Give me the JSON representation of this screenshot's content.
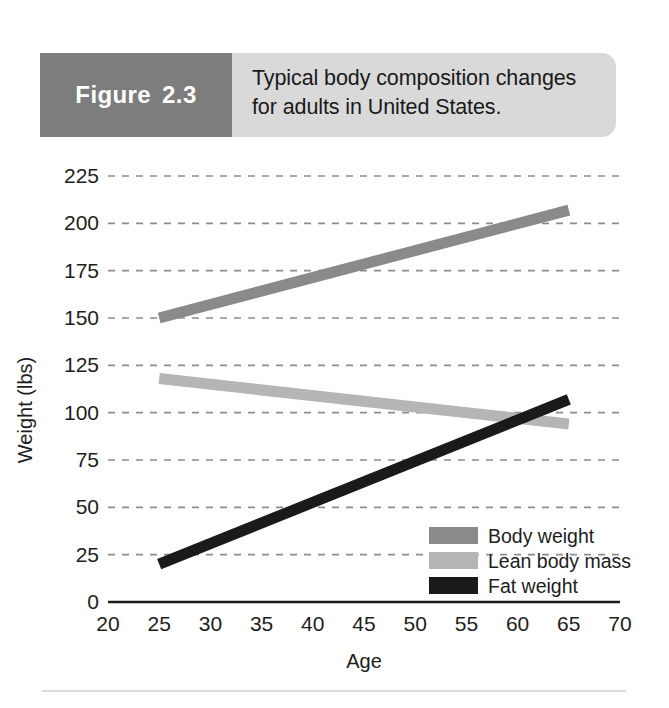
{
  "figure": {
    "tab_word": "Figure",
    "tab_number": "2.3",
    "caption_line1": "Typical body composition changes",
    "caption_line2": "for adults in United States."
  },
  "colors": {
    "tab_background": "#7d7d7d",
    "caption_background": "#d9d9d9",
    "body_weight": "#8a8a8a",
    "lean_body_mass": "#b5b5b5",
    "fat_weight": "#1a1a1a",
    "gridline": "#8d8d8d",
    "axis": "#1d1d1d"
  },
  "chart_data": {
    "type": "line",
    "title": "Typical body composition changes for adults in United States.",
    "xlabel": "Age",
    "ylabel": "Weight (lbs)",
    "xlim": [
      20,
      70
    ],
    "ylim": [
      0,
      225
    ],
    "xticks": [
      "20",
      "25",
      "30",
      "35",
      "40",
      "45",
      "50",
      "55",
      "60",
      "65",
      "70"
    ],
    "yticks": [
      "0",
      "25",
      "50",
      "75",
      "100",
      "125",
      "150",
      "175",
      "200",
      "225"
    ],
    "grid": true,
    "legend_position": "inside-lower-right",
    "x": [
      25,
      65
    ],
    "series": [
      {
        "name": "Body weight",
        "values": [
          150,
          207
        ],
        "color": "#8a8a8a"
      },
      {
        "name": "Lean body mass",
        "values": [
          118,
          94
        ],
        "color": "#b5b5b5"
      },
      {
        "name": "Fat weight",
        "values": [
          20,
          107
        ],
        "color": "#1a1a1a"
      }
    ],
    "annotations": [
      "Lean body mass and fat weight cross at approximately age 60 near 98 lbs."
    ]
  },
  "legend": {
    "items": [
      {
        "label": "Body weight"
      },
      {
        "label": "Lean body mass"
      },
      {
        "label": "Fat weight"
      }
    ]
  }
}
